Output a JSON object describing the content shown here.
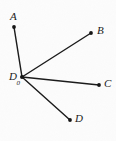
{
  "figure": {
    "type": "geometry-diagram",
    "background_color": "#fcfcfc",
    "line_color": "#1a1a1a",
    "vertex": {
      "id": "D0",
      "label": "D",
      "subscript": "0",
      "x": 22,
      "y": 77,
      "label_x": 9,
      "label_y": 71
    },
    "rays": [
      {
        "id": "ray-A",
        "label": "A",
        "from_x": 22,
        "from_y": 77,
        "to_x": 14,
        "to_y": 27,
        "label_x": 10,
        "label_y": 11
      },
      {
        "id": "ray-B",
        "label": "B",
        "from_x": 22,
        "from_y": 77,
        "to_x": 91,
        "to_y": 33,
        "label_x": 97,
        "label_y": 25
      },
      {
        "id": "ray-C",
        "label": "C",
        "from_x": 22,
        "from_y": 77,
        "to_x": 99,
        "to_y": 85,
        "label_x": 104,
        "label_y": 78
      },
      {
        "id": "ray-D",
        "label": "D",
        "from_x": 22,
        "from_y": 77,
        "to_x": 70,
        "to_y": 120,
        "label_x": 75,
        "label_y": 113
      }
    ]
  }
}
